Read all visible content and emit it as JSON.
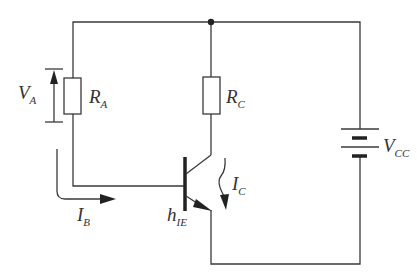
{
  "diagram": {
    "type": "circuit-schematic",
    "components": [
      {
        "id": "RA",
        "kind": "resistor",
        "label": "R",
        "sub": "A"
      },
      {
        "id": "RC",
        "kind": "resistor",
        "label": "R",
        "sub": "C"
      },
      {
        "id": "VCC",
        "kind": "battery",
        "label": "V",
        "sub": "CC"
      },
      {
        "id": "Q",
        "kind": "npn-transistor",
        "label": "h",
        "sub": "IE"
      }
    ],
    "annotations": [
      {
        "id": "VA",
        "kind": "voltage-arrow",
        "label": "V",
        "sub": "A"
      },
      {
        "id": "IB",
        "kind": "current-arrow",
        "label": "I",
        "sub": "B"
      },
      {
        "id": "IC",
        "kind": "current-arrow",
        "label": "I",
        "sub": "C"
      }
    ]
  },
  "labels": {
    "ra": {
      "main": "R",
      "sub": "A"
    },
    "rc": {
      "main": "R",
      "sub": "C"
    },
    "vcc": {
      "main": "V",
      "sub": "CC"
    },
    "va": {
      "main": "V",
      "sub": "A"
    },
    "ib": {
      "main": "I",
      "sub": "B"
    },
    "ic": {
      "main": "I",
      "sub": "C"
    },
    "hie": {
      "main": "h",
      "sub": "IE"
    }
  },
  "colors": {
    "line": "#3a3a3a",
    "text": "#333333",
    "background": "#ffffff"
  }
}
